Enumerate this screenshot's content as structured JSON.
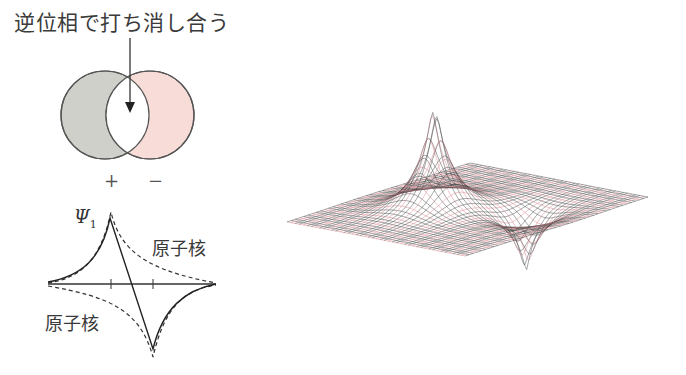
{
  "title": "逆位相で打ち消し合う",
  "venn": {
    "left_sign": "+",
    "right_sign": "−",
    "left_color": "#cfd0ca",
    "right_color": "#f8dcd8",
    "overlap_color": "#ffffff",
    "stroke_color": "#555555"
  },
  "wavefunction_plot": {
    "label": "Ψ",
    "label_subscript": "1",
    "nucleus_label_right": "原子核",
    "nucleus_label_left": "原子核",
    "nucleus_positions": [
      "left",
      "right"
    ],
    "curves": [
      {
        "name": "solid",
        "style": "solid",
        "description": "antibonding combination, peak at left nucleus, trough at right nucleus"
      },
      {
        "name": "dashed-positive",
        "style": "dashed",
        "description": "atomic orbital on left nucleus (positive)"
      },
      {
        "name": "dashed-negative",
        "style": "dashed",
        "description": "atomic orbital on right nucleus (negative)"
      }
    ]
  },
  "surface_plot": {
    "description": "3D wireframe surface of antibonding orbital: positive peak and negative trough",
    "grid_color_a": "#444444",
    "grid_color_b": "#d9828a",
    "peak": "positive",
    "trough": "negative"
  }
}
